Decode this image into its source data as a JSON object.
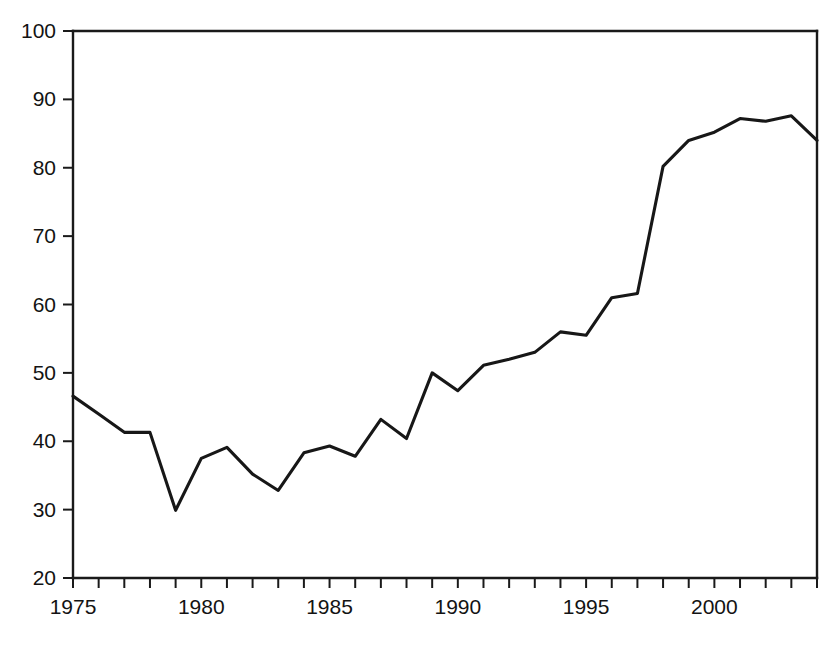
{
  "chart_data": {
    "type": "line",
    "title": "",
    "subtitle": "",
    "xlabel": "",
    "ylabel": "",
    "xlim": [
      1975,
      2004
    ],
    "ylim": [
      20,
      100
    ],
    "grid": false,
    "legend": null,
    "x": [
      1975,
      1976,
      1977,
      1978,
      1979,
      1980,
      1981,
      1982,
      1983,
      1984,
      1985,
      1986,
      1987,
      1988,
      1989,
      1990,
      1991,
      1992,
      1993,
      1994,
      1995,
      1996,
      1997,
      1998,
      1999,
      2000,
      2001,
      2002,
      2003,
      2004
    ],
    "values": [
      46.6,
      44.0,
      41.3,
      41.3,
      29.9,
      37.5,
      39.1,
      35.2,
      32.8,
      38.3,
      39.3,
      37.8,
      43.2,
      40.4,
      50.0,
      47.4,
      51.1,
      52.0,
      53.0,
      56.0,
      55.5,
      61.0,
      61.6,
      80.2,
      84.0,
      85.2,
      87.2,
      86.8,
      87.6,
      84.0
    ],
    "series": [
      {
        "name": "series-1",
        "color": "#171717",
        "values": [
          46.6,
          44.0,
          41.3,
          41.3,
          29.9,
          37.5,
          39.1,
          35.2,
          32.8,
          38.3,
          39.3,
          37.8,
          43.2,
          40.4,
          50.0,
          47.4,
          51.1,
          52.0,
          53.0,
          56.0,
          55.5,
          61.0,
          61.6,
          80.2,
          84.0,
          85.2,
          87.2,
          86.8,
          87.6,
          84.0
        ]
      }
    ],
    "y_ticks": [
      20,
      30,
      40,
      50,
      60,
      70,
      80,
      90,
      100
    ],
    "y_tick_labels": [
      "20",
      "30",
      "40",
      "50",
      "60",
      "70",
      "80",
      "90",
      "100"
    ],
    "x_ticks": [
      1975,
      1976,
      1977,
      1978,
      1979,
      1980,
      1981,
      1982,
      1983,
      1984,
      1985,
      1986,
      1987,
      1988,
      1989,
      1990,
      1991,
      1992,
      1993,
      1994,
      1995,
      1996,
      1997,
      1998,
      1999,
      2000,
      2001,
      2002,
      2003,
      2004
    ],
    "x_tick_labels": [
      {
        "value": 1975,
        "label": "1975"
      },
      {
        "value": 1980,
        "label": "1980"
      },
      {
        "value": 1985,
        "label": "1985"
      },
      {
        "value": 1990,
        "label": "1990"
      },
      {
        "value": 1995,
        "label": "1995"
      },
      {
        "value": 2000,
        "label": "2000"
      }
    ],
    "colors": {
      "line": "#171717",
      "axis": "#1a1a1a",
      "text": "#131313",
      "background": "#ffffff"
    }
  },
  "plot_geometry": {
    "left": 73,
    "right": 817,
    "top": 31,
    "bottom": 578
  }
}
